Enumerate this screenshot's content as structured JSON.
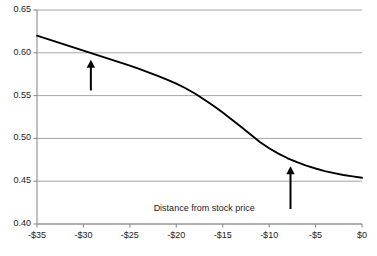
{
  "chart_data": {
    "type": "line",
    "title": "",
    "subtitle": "",
    "xlabel": "Distance from stock price",
    "ylabel": "",
    "xlim": [
      -35,
      0
    ],
    "ylim": [
      0.4,
      0.65
    ],
    "grid": true,
    "legend": false,
    "x_tick_labels": [
      "-$35",
      "-$30",
      "-$25",
      "-$20",
      "-$15",
      "-$10",
      "-$5",
      "$0"
    ],
    "x_ticks": [
      -35,
      -30,
      -25,
      -20,
      -15,
      -10,
      -5,
      0
    ],
    "y_tick_labels": [
      "0.40",
      "0.45",
      "0.50",
      "0.55",
      "0.60",
      "0.65"
    ],
    "y_ticks": [
      0.4,
      0.45,
      0.5,
      0.55,
      0.6,
      0.65
    ],
    "series": [
      {
        "name": "curve",
        "color": "#000000",
        "x": [
          -35,
          -34,
          -33,
          -32,
          -31,
          -30,
          -29,
          -28,
          -27,
          -26,
          -25,
          -24,
          -23,
          -22,
          -21,
          -20,
          -19,
          -18,
          -17,
          -16,
          -15,
          -14,
          -13,
          -12,
          -11,
          -10,
          -9,
          -8,
          -7,
          -6,
          -5,
          -4,
          -3,
          -2,
          -1,
          0
        ],
        "values": [
          0.62,
          0.6165,
          0.613,
          0.6095,
          0.606,
          0.6025,
          0.599,
          0.5955,
          0.592,
          0.5885,
          0.585,
          0.5812,
          0.5772,
          0.573,
          0.5686,
          0.564,
          0.5586,
          0.5525,
          0.5455,
          0.5382,
          0.5302,
          0.5218,
          0.5132,
          0.5045,
          0.4958,
          0.4885,
          0.4822,
          0.4768,
          0.4722,
          0.4682,
          0.4648,
          0.4618,
          0.4594,
          0.4572,
          0.4556,
          0.454
        ]
      }
    ],
    "annotations": [
      {
        "name": "left-up-arrow",
        "type": "arrow",
        "direction": "up",
        "x": -29.2,
        "y_base": 0.556,
        "y_tip": 0.592
      },
      {
        "name": "right-up-arrow",
        "type": "arrow",
        "direction": "up",
        "x": -7.7,
        "y_base": 0.4175,
        "y_tip": 0.4675
      },
      {
        "name": "x-axis-caption",
        "type": "text",
        "text": "Distance from stock price",
        "x": -17.0,
        "y": 0.4175
      }
    ],
    "colors": {
      "line": "#000000",
      "grid": "#a6a6a6",
      "axis": "#8c8c8c",
      "text": "#1b1b1b",
      "background": "#ffffff"
    }
  }
}
